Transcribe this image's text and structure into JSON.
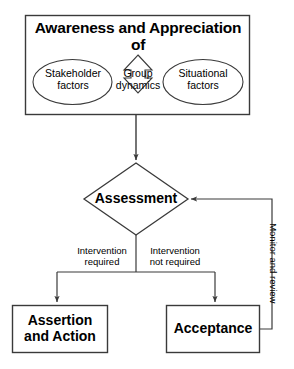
{
  "diagram": {
    "title_box": {
      "heading": "Awareness and Appreciation of",
      "nodes": {
        "stakeholder": "Stakeholder\nfactors",
        "group_dynamics": "Group\ndynamics",
        "situational": "Situational\nfactors"
      }
    },
    "decision": {
      "label": "Assessment"
    },
    "branches": {
      "left_label": "Intervention\nrequired",
      "right_label": "Intervention\nnot required"
    },
    "outcomes": {
      "left": "Assertion\nand Action",
      "right": "Acceptance"
    },
    "feedback": {
      "label": "Monitor and review"
    },
    "colors": {
      "stroke": "#3a3a3a",
      "text": "#000000",
      "background": "#ffffff"
    }
  }
}
